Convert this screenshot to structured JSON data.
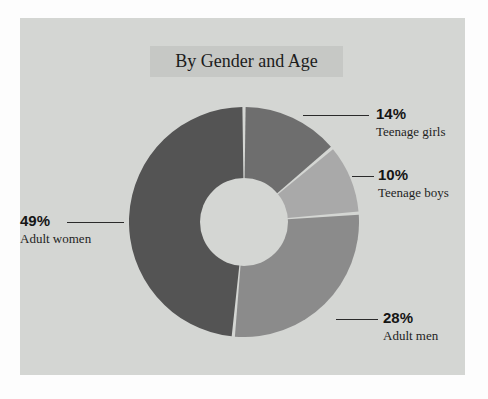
{
  "chart_data": {
    "type": "pie",
    "variant": "donut",
    "title": "By Gender and Age",
    "xlabel": "",
    "ylabel": "",
    "legend_position": "callout-labels",
    "grid": false,
    "unit": "%",
    "categories": [
      "Teenage girls",
      "Teenage boys",
      "Adult men",
      "Adult women"
    ],
    "values": [
      14,
      10,
      28,
      49
    ],
    "value_labels": [
      "14%",
      "10%",
      "28%",
      "49%"
    ],
    "colors": [
      "#6e6e6e",
      "#a9a9a9",
      "#8b8b8b",
      "#545454"
    ],
    "slices": [
      {
        "label": "Teenage girls",
        "value": 14,
        "value_label": "14%",
        "color": "#6e6e6e"
      },
      {
        "label": "Teenage boys",
        "value": 10,
        "value_label": "10%",
        "color": "#a9a9a9"
      },
      {
        "label": "Adult men",
        "value": 28,
        "value_label": "28%",
        "color": "#8b8b8b"
      },
      {
        "label": "Adult women",
        "value": 49,
        "value_label": "49%",
        "color": "#545454"
      }
    ]
  },
  "panel": {
    "background_color": "#d4d6d3",
    "title_band_color": "#c6c8c5"
  },
  "title": {
    "text": "By Gender and Age"
  },
  "callouts": {
    "teenage_girls": {
      "pct": "14%",
      "cat": "Teenage girls"
    },
    "teenage_boys": {
      "pct": "10%",
      "cat": "Teenage boys"
    },
    "adult_men": {
      "pct": "28%",
      "cat": "Adult men"
    },
    "adult_women": {
      "pct": "49%",
      "cat": "Adult women"
    }
  }
}
